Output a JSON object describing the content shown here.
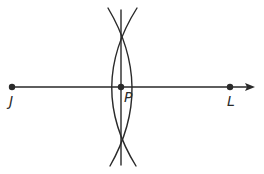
{
  "diagram": {
    "points": [
      {
        "id": "J",
        "label": "J",
        "x": 12,
        "y": 87
      },
      {
        "id": "P",
        "label": "P",
        "x": 121,
        "y": 87
      },
      {
        "id": "L",
        "label": "L",
        "x": 230,
        "y": 87
      }
    ],
    "ray": {
      "from": "J",
      "through": "L",
      "arrow": true
    },
    "perpendicular_line": {
      "through": "P",
      "orientation": "vertical"
    },
    "arcs": {
      "count": 2,
      "intersections": [
        "top",
        "bottom"
      ]
    },
    "colors": {
      "stroke": "#2a2a2a",
      "background": "#ffffff"
    }
  }
}
